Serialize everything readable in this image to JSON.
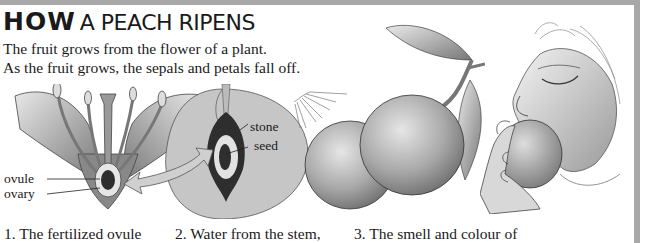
{
  "header": {
    "title_bold": "HOW",
    "title_rest": "A PEACH RIPENS"
  },
  "intro": {
    "line1": "The fruit grows from the flower of a plant.",
    "line2": "As the fruit grows, the sepals and petals fall off."
  },
  "diagram": {
    "labels": {
      "ovule": "ovule",
      "ovary": "ovary",
      "stone": "stone",
      "seed": "seed"
    }
  },
  "captions": [
    {
      "number": "1.",
      "text": "1. The fertilized ovule"
    },
    {
      "number": "2.",
      "text": "2. Water from the stem,"
    },
    {
      "number": "3.",
      "text": "3. The smell and colour of"
    }
  ],
  "colors": {
    "border": "#a8a8a8",
    "text": "#1a1a1a",
    "illustration_gray": "#b8b8b8",
    "dark": "#2e2e2e"
  }
}
